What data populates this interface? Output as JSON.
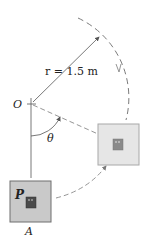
{
  "diagram": {
    "labels": {
      "radius": "r = 1.5 m",
      "pivot": "O",
      "angle": "θ",
      "point": "P",
      "position": "A"
    },
    "colors": {
      "line": "#555555",
      "dash": "#7a7a7a",
      "box_a_fill": "#c9c9c9",
      "box_a_stroke": "#6e6e6e",
      "box_b_fill": "#e6e6e6",
      "box_b_stroke": "#a8a8a8",
      "inner_a": "#4a4a4a",
      "inner_b": "#8a8a8a"
    }
  }
}
